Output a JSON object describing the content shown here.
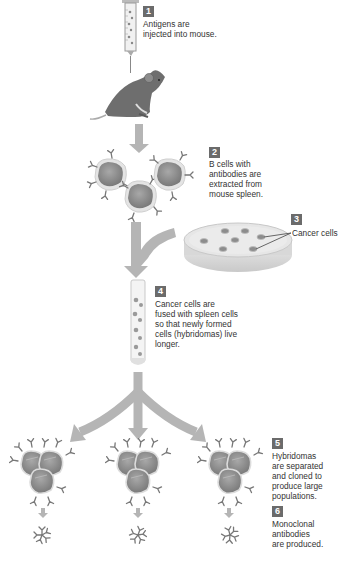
{
  "diagram": {
    "colors": {
      "arrow": "#b5b5b5",
      "cell_fill": "#8a8a8a",
      "cell_border": "#d9d9d9",
      "badge": "#6b6b6b",
      "text": "#333333"
    },
    "steps": [
      {
        "number": "1",
        "text_lines": [
          "Antigens are",
          "injected into mouse."
        ]
      },
      {
        "number": "2",
        "text_lines": [
          "B cells with",
          "antibodies are",
          "extracted from",
          "mouse spleen."
        ]
      },
      {
        "number": "3",
        "label": "Cancer cells"
      },
      {
        "number": "4",
        "text_lines": [
          "Cancer cells are",
          "fused with spleen cells",
          "so that newly formed",
          "cells (hybridomas) live",
          "longer."
        ]
      },
      {
        "number": "5",
        "text_lines": [
          "Hybridomas",
          "are separated",
          "and cloned to",
          "produce large",
          "populations."
        ]
      },
      {
        "number": "6",
        "text_lines": [
          "Monoclonal",
          "antibodies",
          "are produced."
        ]
      }
    ],
    "icons": [
      "syringe-icon",
      "mouse-icon",
      "b-cell-icon",
      "petri-dish-icon",
      "test-tube-icon",
      "hybridoma-cluster-icon",
      "antibody-icon",
      "arrow-down-icon"
    ]
  }
}
